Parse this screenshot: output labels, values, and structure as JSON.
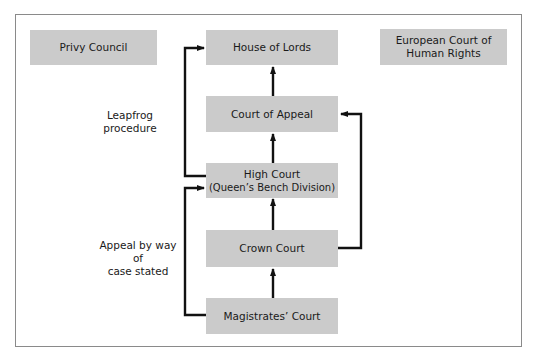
{
  "diagram": {
    "type": "court-hierarchy-flow",
    "colors": {
      "box_fill": "#cbcbcb",
      "line": "#111111",
      "frame": "#8a8a8a"
    },
    "standalone_boxes": {
      "privy_council": "Privy Council",
      "echr_line1": "European Court of",
      "echr_line2": "Human Rights"
    },
    "courts": {
      "house_of_lords": "House of Lords",
      "court_of_appeal": "Court of Appeal",
      "high_court_line1": "High Court",
      "high_court_line2": "(Queen’s Bench Division)",
      "crown_court": "Crown Court",
      "magistrates_court": "Magistrates’ Court"
    },
    "route_labels": {
      "leapfrog": "Leapfrog procedure",
      "case_stated_line1": "Appeal by way of",
      "case_stated_line2": "case stated"
    },
    "edges": [
      {
        "from": "Court of Appeal",
        "to": "House of Lords"
      },
      {
        "from": "High Court (Queen’s Bench Division)",
        "to": "Court of Appeal"
      },
      {
        "from": "Crown Court",
        "to": "High Court (Queen’s Bench Division)"
      },
      {
        "from": "Magistrates’ Court",
        "to": "Crown Court"
      },
      {
        "from": "High Court (Queen’s Bench Division)",
        "to": "House of Lords",
        "label": "Leapfrog procedure"
      },
      {
        "from": "Magistrates’ Court",
        "to": "High Court (Queen’s Bench Division)",
        "label": "Appeal by way of case stated"
      },
      {
        "from": "Crown Court",
        "to": "Court of Appeal"
      }
    ]
  }
}
